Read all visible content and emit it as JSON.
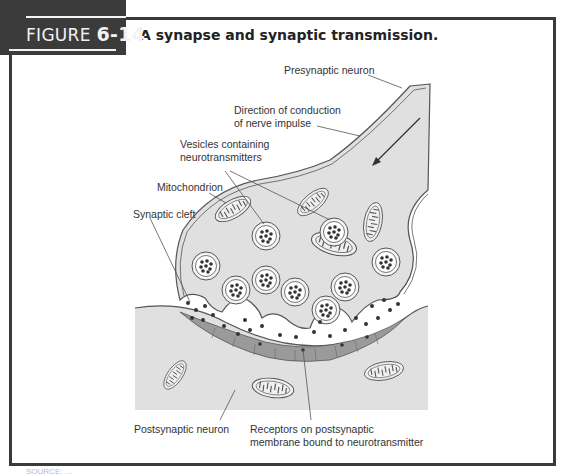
{
  "figure": {
    "tag_prefix": "FIGURE",
    "tag_number": "6-14",
    "title": "A synapse and synaptic transmission."
  },
  "labels": {
    "presynaptic_neuron": "Presynaptic neuron",
    "direction_line1": "Direction of conduction",
    "direction_line2": "of nerve impulse",
    "vesicles_line1": "Vesicles containing",
    "vesicles_line2": "neurotransmitters",
    "mitochondrion": "Mitochondrion",
    "synaptic_cleft": "Synaptic cleft",
    "postsynaptic_neuron": "Postsynaptic neuron",
    "receptors_line1": "Receptors on postsynaptic",
    "receptors_line2": "membrane bound to neurotransmitter"
  },
  "colors": {
    "frame": "#3a3a3a",
    "tag_bg": "#3b3b3b",
    "cell_fill": "#e2e2e2",
    "receptor_band": "#9a9a9a",
    "line": "#555555"
  },
  "source": {
    "text": "SOURCE: …"
  }
}
